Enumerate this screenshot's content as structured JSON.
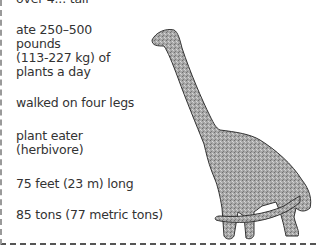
{
  "facts": [
    {
      "id": "height",
      "lines": [
        "over 4... tall"
      ]
    },
    {
      "id": "diet_amount",
      "lines": [
        "ate 250–500",
        "pounds",
        "(113-227 kg) of",
        "plants a day"
      ]
    },
    {
      "id": "locomotion",
      "lines": [
        "walked on four legs"
      ]
    },
    {
      "id": "diet_type",
      "lines": [
        "plant eater",
        "(herbivore)"
      ]
    },
    {
      "id": "length",
      "lines": [
        "75 feet (23 m) long"
      ]
    },
    {
      "id": "weight",
      "lines": [
        "85 tons (77 metric tons)"
      ]
    }
  ],
  "illustration": {
    "subject": "sauropod dinosaur (long neck, four legs)",
    "fill": "#9a9a9a",
    "outline": "#333333"
  }
}
